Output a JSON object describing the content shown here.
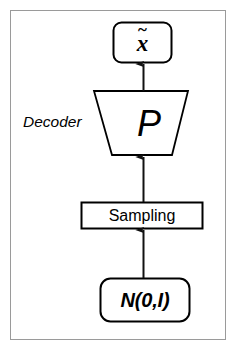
{
  "figure": {
    "colors": {
      "frame_border": "#9a9a9a",
      "shape_stroke": "#000000",
      "shape_fill": "#ffffff",
      "text": "#000000",
      "background": "#ffffff"
    }
  },
  "nodes": {
    "output": {
      "label": "x",
      "accent": "~",
      "shape": "rounded-rectangle"
    },
    "decoder": {
      "side_label": "Decoder",
      "inner_label": "P",
      "shape": "inverted-trapezoid"
    },
    "sampling": {
      "label": "Sampling",
      "shape": "rectangle"
    },
    "noise": {
      "label": "N(0,I)",
      "shape": "rounded-rectangle"
    }
  },
  "edges": [
    {
      "from": "noise",
      "to": "sampling",
      "style": "arrow-up"
    },
    {
      "from": "sampling",
      "to": "decoder",
      "style": "arrow-up"
    },
    {
      "from": "decoder",
      "to": "output",
      "style": "arrow-up"
    }
  ]
}
